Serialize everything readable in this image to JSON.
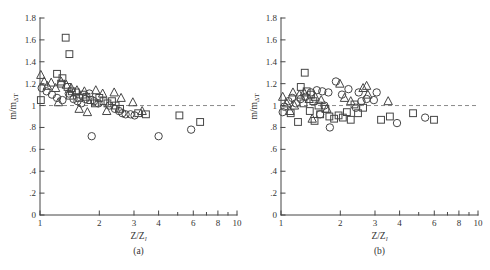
{
  "colors": {
    "ink": "#454545",
    "dash": "#8a8a8a",
    "background": "#ffffff"
  },
  "chart_data": [
    {
      "type": "scatter",
      "id": "a",
      "panel_caption": "(a)",
      "xlabel_base": "Z/Z",
      "xlabel_sub": "l",
      "ylabel_base": "m/m",
      "ylabel_sub": "ΔT",
      "x_scale": "log",
      "xlim": [
        1,
        10
      ],
      "ylim": [
        0,
        1.8
      ],
      "grid": "off",
      "legend": "none",
      "reference_line_y": 1,
      "x_ticks": [
        {
          "v": 1,
          "label": "1"
        },
        {
          "v": 2,
          "label": "2"
        },
        {
          "v": 3,
          "label": "3"
        },
        {
          "v": 4,
          "label": "4"
        },
        {
          "v": 5,
          "label": ""
        },
        {
          "v": 6,
          "label": "6"
        },
        {
          "v": 7,
          "label": ""
        },
        {
          "v": 8,
          "label": "8"
        },
        {
          "v": 9,
          "label": ""
        },
        {
          "v": 10,
          "label": "10"
        }
      ],
      "y_ticks": [
        {
          "v": 0,
          "label": "0"
        },
        {
          "v": 0.2,
          "label": ".2"
        },
        {
          "v": 0.4,
          "label": ".4"
        },
        {
          "v": 0.6,
          "label": ".6"
        },
        {
          "v": 0.8,
          "label": ".8"
        },
        {
          "v": 1,
          "label": "1"
        },
        {
          "v": 1.2,
          "label": "1.2"
        },
        {
          "v": 1.4,
          "label": "1.4"
        },
        {
          "v": 1.6,
          "label": "1.6"
        },
        {
          "v": 1.8,
          "label": "1.8"
        }
      ],
      "series": [
        {
          "name": "squares",
          "marker": "square",
          "points": [
            [
              1.35,
              1.62
            ],
            [
              1.41,
              1.47
            ],
            [
              1.01,
              1.05
            ],
            [
              1.22,
              1.29
            ],
            [
              1.3,
              1.25
            ],
            [
              1.28,
              1.2
            ],
            [
              1.38,
              1.17
            ],
            [
              1.45,
              1.13
            ],
            [
              1.42,
              1.09
            ],
            [
              1.52,
              1.12
            ],
            [
              1.58,
              1.07
            ],
            [
              1.65,
              1.1
            ],
            [
              1.72,
              1.08
            ],
            [
              1.8,
              1.05
            ],
            [
              1.9,
              1.02
            ],
            [
              2.0,
              1.07
            ],
            [
              2.1,
              1.04
            ],
            [
              2.2,
              1.02
            ],
            [
              2.32,
              1.04
            ],
            [
              2.42,
              1.0
            ],
            [
              2.55,
              0.97
            ],
            [
              3.15,
              0.93
            ],
            [
              3.45,
              0.92
            ],
            [
              5.1,
              0.91
            ],
            [
              6.5,
              0.85
            ]
          ]
        },
        {
          "name": "circles",
          "marker": "circle",
          "points": [
            [
              1.02,
              1.16
            ],
            [
              1.08,
              1.13
            ],
            [
              1.15,
              1.1
            ],
            [
              1.22,
              1.07
            ],
            [
              1.3,
              1.05
            ],
            [
              1.4,
              1.11
            ],
            [
              1.48,
              1.06
            ],
            [
              1.55,
              1.04
            ],
            [
              1.62,
              1.02
            ],
            [
              1.7,
              1.06
            ],
            [
              1.78,
              1.11
            ],
            [
              1.88,
              1.04
            ],
            [
              1.98,
              1.02
            ],
            [
              2.25,
              1.0
            ],
            [
              2.4,
              0.97
            ],
            [
              2.52,
              0.95
            ],
            [
              2.62,
              0.93
            ],
            [
              2.72,
              0.92
            ],
            [
              2.88,
              0.92
            ],
            [
              3.02,
              0.91
            ],
            [
              1.83,
              0.72
            ],
            [
              4.0,
              0.72
            ],
            [
              5.85,
              0.78
            ]
          ]
        },
        {
          "name": "triangles",
          "marker": "triangle",
          "points": [
            [
              1.01,
              1.28
            ],
            [
              1.05,
              1.22
            ],
            [
              1.09,
              1.18
            ],
            [
              1.14,
              1.21
            ],
            [
              1.2,
              1.16
            ],
            [
              1.28,
              1.22
            ],
            [
              1.36,
              1.19
            ],
            [
              1.44,
              1.16
            ],
            [
              1.54,
              1.14
            ],
            [
              1.68,
              1.13
            ],
            [
              1.92,
              1.14
            ],
            [
              2.08,
              1.11
            ],
            [
              2.38,
              1.12
            ],
            [
              2.58,
              1.07
            ],
            [
              2.96,
              1.03
            ],
            [
              1.24,
              1.03
            ],
            [
              1.58,
              0.97
            ],
            [
              1.74,
              0.94
            ],
            [
              2.18,
              0.95
            ],
            [
              3.3,
              0.95
            ]
          ]
        }
      ]
    },
    {
      "type": "scatter",
      "id": "b",
      "panel_caption": "(b)",
      "xlabel_base": "Z/Z",
      "xlabel_sub": "l",
      "ylabel_base": "m/m",
      "ylabel_sub": "ΔT",
      "x_scale": "log",
      "xlim": [
        1,
        10
      ],
      "ylim": [
        0,
        1.8
      ],
      "grid": "off",
      "legend": "none",
      "reference_line_y": 1,
      "x_ticks": [
        {
          "v": 1,
          "label": "1"
        },
        {
          "v": 2,
          "label": "2"
        },
        {
          "v": 3,
          "label": "3"
        },
        {
          "v": 4,
          "label": "4"
        },
        {
          "v": 5,
          "label": ""
        },
        {
          "v": 6,
          "label": "6"
        },
        {
          "v": 7,
          "label": ""
        },
        {
          "v": 8,
          "label": "8"
        },
        {
          "v": 9,
          "label": ""
        },
        {
          "v": 10,
          "label": "10"
        }
      ],
      "y_ticks": [
        {
          "v": 0,
          "label": "0"
        },
        {
          "v": 0.2,
          "label": ".2"
        },
        {
          "v": 0.4,
          "label": ".4"
        },
        {
          "v": 0.6,
          "label": ".6"
        },
        {
          "v": 0.8,
          "label": ".8"
        },
        {
          "v": 1,
          "label": "1"
        },
        {
          "v": 1.2,
          "label": "1.2"
        },
        {
          "v": 1.4,
          "label": "1.4"
        },
        {
          "v": 1.6,
          "label": "1.6"
        },
        {
          "v": 1.8,
          "label": "1.8"
        }
      ],
      "series": [
        {
          "name": "squares",
          "marker": "square",
          "points": [
            [
              1.32,
              1.3
            ],
            [
              1.26,
              1.17
            ],
            [
              1.35,
              1.13
            ],
            [
              1.42,
              1.1
            ],
            [
              1.3,
              1.02
            ],
            [
              1.46,
              1.04
            ],
            [
              1.55,
              1.0
            ],
            [
              1.4,
              0.95
            ],
            [
              1.48,
              0.86
            ],
            [
              1.58,
              0.92
            ],
            [
              1.68,
              0.97
            ],
            [
              1.76,
              0.9
            ],
            [
              1.86,
              0.88
            ],
            [
              1.96,
              0.91
            ],
            [
              2.06,
              0.89
            ],
            [
              2.16,
              0.94
            ],
            [
              2.26,
              0.87
            ],
            [
              2.36,
              1.01
            ],
            [
              2.46,
              0.93
            ],
            [
              2.61,
              0.98
            ],
            [
              3.22,
              0.87
            ],
            [
              3.57,
              0.9
            ],
            [
              4.68,
              0.93
            ],
            [
              5.98,
              0.87
            ],
            [
              1.22,
              0.85
            ],
            [
              1.12,
              0.93
            ]
          ]
        },
        {
          "name": "circles",
          "marker": "circle",
          "points": [
            [
              1.02,
              0.94
            ],
            [
              1.04,
              0.99
            ],
            [
              1.09,
              1.04
            ],
            [
              1.14,
              1.07
            ],
            [
              1.19,
              1.02
            ],
            [
              1.26,
              1.06
            ],
            [
              1.33,
              1.08
            ],
            [
              1.42,
              1.12
            ],
            [
              1.52,
              1.14
            ],
            [
              1.62,
              1.13
            ],
            [
              1.74,
              1.12
            ],
            [
              1.9,
              1.22
            ],
            [
              2.04,
              1.1
            ],
            [
              2.2,
              1.15
            ],
            [
              2.48,
              1.12
            ],
            [
              2.56,
              1.04
            ],
            [
              2.72,
              1.06
            ],
            [
              1.66,
              1.0
            ],
            [
              1.58,
              0.92
            ],
            [
              1.77,
              0.8
            ],
            [
              2.4,
              0.98
            ],
            [
              2.96,
              1.05
            ],
            [
              3.06,
              1.12
            ],
            [
              3.88,
              0.84
            ],
            [
              5.39,
              0.89
            ]
          ]
        },
        {
          "name": "triangles",
          "marker": "triangle",
          "points": [
            [
              1.02,
              1.08
            ],
            [
              1.07,
              1.02
            ],
            [
              1.11,
              0.95
            ],
            [
              1.17,
              1.0
            ],
            [
              1.24,
              1.1
            ],
            [
              1.31,
              1.12
            ],
            [
              1.39,
              1.06
            ],
            [
              1.49,
              1.08
            ],
            [
              1.6,
              1.05
            ],
            [
              1.71,
              0.97
            ],
            [
              1.99,
              1.2
            ],
            [
              2.1,
              1.07
            ],
            [
              2.26,
              1.04
            ],
            [
              2.61,
              1.16
            ],
            [
              2.76,
              1.1
            ],
            [
              3.5,
              1.04
            ],
            [
              1.44,
              0.88
            ],
            [
              1.15,
              1.12
            ],
            [
              2.72,
              1.18
            ]
          ]
        }
      ]
    }
  ]
}
